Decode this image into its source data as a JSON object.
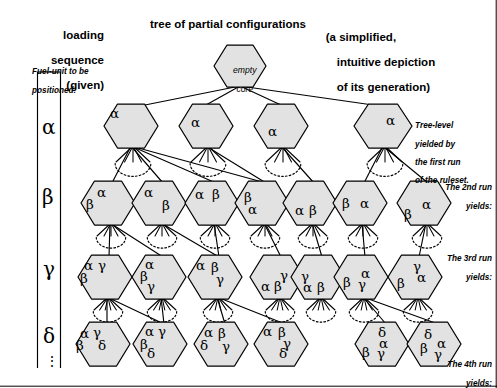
{
  "headers": {
    "left_line1": "loading",
    "left_line2": "sequence",
    "left_line3": "(given)",
    "middle": "tree of partial configurations",
    "right_line1": "(a simplified,",
    "right_line2": "intuitive depiction",
    "right_line3": "of its generation)"
  },
  "legend": {
    "caption_line1": "Fuel-unit to be",
    "caption_line2": "positioned:",
    "levels": [
      "α",
      "β",
      "γ",
      "δ"
    ],
    "continuation": "⋮"
  },
  "annotations": {
    "run1_line1": "Tree-level",
    "run1_line2": "yielded by",
    "run1_line3": "the first run",
    "run1_line4": "of the ruleset.",
    "run2_line1": "The 2nd run",
    "run2_line2": "yields:",
    "run3_line1": "The 3rd run",
    "run3_line2": "yields:",
    "run4_line1": "The 4th run",
    "run4_line2": "yields:"
  },
  "root": {
    "label_line1": "empty",
    "label_line2": "core"
  },
  "tree": {
    "level_alpha": [
      {
        "cells": [
          {
            "t": "α",
            "dx": -16,
            "dy": -11
          }
        ]
      },
      {
        "cells": [
          {
            "t": "α",
            "dx": -10,
            "dy": -2
          }
        ]
      },
      {
        "cells": [
          {
            "t": "α",
            "dx": -8,
            "dy": 7
          }
        ]
      },
      {
        "cells": [
          {
            "t": "α",
            "dx": 8,
            "dy": -4
          }
        ]
      }
    ],
    "level_beta": [
      {
        "cells": [
          {
            "t": "α",
            "dx": -6,
            "dy": -9
          },
          {
            "t": "β",
            "dx": -17,
            "dy": 3
          }
        ]
      },
      {
        "cells": [
          {
            "t": "α",
            "dx": -10,
            "dy": -9
          },
          {
            "t": "β",
            "dx": 8,
            "dy": 4
          }
        ]
      },
      {
        "cells": [
          {
            "t": "α",
            "dx": -12,
            "dy": -7
          },
          {
            "t": "β",
            "dx": 5,
            "dy": -7
          }
        ]
      },
      {
        "cells": [
          {
            "t": "β",
            "dx": -13,
            "dy": -4
          },
          {
            "t": "α",
            "dx": -9,
            "dy": 8
          }
        ]
      },
      {
        "cells": [
          {
            "t": "α",
            "dx": -10,
            "dy": 9
          },
          {
            "t": "β",
            "dx": 4,
            "dy": 9
          }
        ]
      },
      {
        "cells": [
          {
            "t": "β",
            "dx": -13,
            "dy": 2
          },
          {
            "t": "α",
            "dx": 5,
            "dy": 2
          }
        ]
      },
      {
        "cells": [
          {
            "t": "α",
            "dx": 3,
            "dy": 3
          },
          {
            "t": "β",
            "dx": -15,
            "dy": 13
          }
        ]
      }
    ],
    "level_gamma": [
      {
        "cells": [
          {
            "t": "α",
            "dx": -16,
            "dy": -10
          },
          {
            "t": "γ",
            "dx": -2,
            "dy": -10
          },
          {
            "t": "β",
            "dx": -20,
            "dy": 3
          }
        ]
      },
      {
        "cells": [
          {
            "t": "α",
            "dx": -9,
            "dy": -11
          },
          {
            "t": "β",
            "dx": -14,
            "dy": 1
          },
          {
            "t": "γ",
            "dx": -7,
            "dy": 11
          }
        ]
      },
      {
        "cells": [
          {
            "t": "α",
            "dx": -14,
            "dy": -10
          },
          {
            "t": "β",
            "dx": 1,
            "dy": -8
          },
          {
            "t": "γ",
            "dx": 6,
            "dy": 4
          }
        ]
      },
      {
        "cells": [
          {
            "t": "γ",
            "dx": 8,
            "dy": 0
          },
          {
            "t": "α",
            "dx": -11,
            "dy": 11
          },
          {
            "t": "β",
            "dx": 2,
            "dy": 11
          }
        ]
      },
      {
        "cells": [
          {
            "t": "γ",
            "dx": -12,
            "dy": 1
          },
          {
            "t": "α",
            "dx": -10,
            "dy": 12
          },
          {
            "t": "β",
            "dx": 4,
            "dy": 12
          }
        ]
      },
      {
        "cells": [
          {
            "t": "β",
            "dx": -13,
            "dy": 7
          },
          {
            "t": "α",
            "dx": 5,
            "dy": -2
          },
          {
            "t": "γ",
            "dx": 2,
            "dy": 9
          }
        ]
      },
      {
        "cells": [
          {
            "t": "γ",
            "dx": 3,
            "dy": -9
          },
          {
            "t": "α",
            "dx": 7,
            "dy": 2
          },
          {
            "t": "β",
            "dx": -13,
            "dy": 8
          }
        ]
      }
    ],
    "level_delta": [
      {
        "cells": [
          {
            "t": "α",
            "dx": -18,
            "dy": -9
          },
          {
            "t": "γ",
            "dx": -5,
            "dy": -10
          },
          {
            "t": "β",
            "dx": -22,
            "dy": 3
          },
          {
            "t": "δ",
            "dx": 0,
            "dy": 3
          }
        ]
      },
      {
        "cells": [
          {
            "t": "α",
            "dx": -10,
            "dy": -11
          },
          {
            "t": "γ",
            "dx": 3,
            "dy": -11
          },
          {
            "t": "β",
            "dx": -15,
            "dy": 2
          },
          {
            "t": "δ",
            "dx": -8,
            "dy": 11
          }
        ]
      },
      {
        "cells": [
          {
            "t": "α",
            "dx": -12,
            "dy": -10
          },
          {
            "t": "β",
            "dx": 2,
            "dy": -9
          },
          {
            "t": "δ",
            "dx": -16,
            "dy": 3
          },
          {
            "t": "γ",
            "dx": 6,
            "dy": 4
          }
        ]
      },
      {
        "cells": [
          {
            "t": "α",
            "dx": -13,
            "dy": -11
          },
          {
            "t": "β",
            "dx": 2,
            "dy": -10
          },
          {
            "t": "γ",
            "dx": 7,
            "dy": 1
          },
          {
            "t": "δ",
            "dx": 3,
            "dy": 11
          }
        ]
      },
      {
        "cells": [
          {
            "t": "δ",
            "dx": 1,
            "dy": -10
          },
          {
            "t": "α",
            "dx": 2,
            "dy": 1
          },
          {
            "t": "β",
            "dx": -15,
            "dy": 10
          },
          {
            "t": "γ",
            "dx": 0,
            "dy": 11
          }
        ]
      },
      {
        "cells": [
          {
            "t": "δ",
            "dx": -5,
            "dy": -8
          },
          {
            "t": "α",
            "dx": 8,
            "dy": 1
          },
          {
            "t": "β",
            "dx": -9,
            "dy": 6
          },
          {
            "t": "γ",
            "dx": 5,
            "dy": 12
          }
        ]
      }
    ]
  },
  "colors": {
    "hex_fill": "#e2e2e2",
    "stroke": "#000000",
    "background": "#ffffff"
  }
}
